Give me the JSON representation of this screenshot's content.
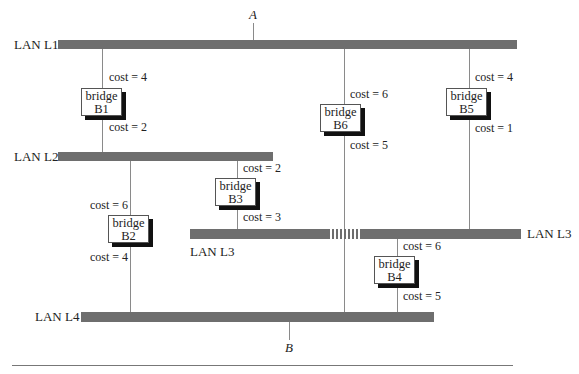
{
  "diagram": {
    "type": "bridged-LAN spanning tree topology",
    "endpoints": {
      "a": {
        "label": "A",
        "attached_to": "LAN L1"
      },
      "b": {
        "label": "B",
        "attached_to": "LAN L4"
      }
    },
    "lans": {
      "l1": {
        "label": "LAN L1"
      },
      "l2": {
        "label": "LAN L2"
      },
      "l3": {
        "label": "LAN L3",
        "label_right": "LAN L3"
      },
      "l4": {
        "label": "LAN L4"
      }
    },
    "bridges": {
      "b1": {
        "word": "bridge",
        "name": "B1",
        "cost_top": "cost = 4",
        "cost_bottom": "cost = 2",
        "connects": [
          "LAN L1",
          "LAN L2"
        ]
      },
      "b2": {
        "word": "bridge",
        "name": "B2",
        "cost_top": "cost = 6",
        "cost_bottom": "cost = 4",
        "connects": [
          "LAN L2",
          "LAN L4"
        ]
      },
      "b3": {
        "word": "bridge",
        "name": "B3",
        "cost_top": "cost = 2",
        "cost_bottom": "cost = 3",
        "connects": [
          "LAN L2",
          "LAN L3"
        ]
      },
      "b4": {
        "word": "bridge",
        "name": "B4",
        "cost_top": "cost = 6",
        "cost_bottom": "cost = 5",
        "connects": [
          "LAN L3",
          "LAN L4"
        ]
      },
      "b5": {
        "word": "bridge",
        "name": "B5",
        "cost_top": "cost = 4",
        "cost_bottom": "cost = 1",
        "connects": [
          "LAN L1",
          "LAN L3"
        ]
      },
      "b6": {
        "word": "bridge",
        "name": "B6",
        "cost_top": "cost = 6",
        "cost_bottom": "cost = 5",
        "connects": [
          "LAN L1",
          "LAN L4"
        ]
      }
    },
    "colors": {
      "lan_bar": "#6e6e6e",
      "link_line": "#8a8a8a",
      "bridge_shadow": "#111111",
      "background": "#ffffff"
    }
  }
}
